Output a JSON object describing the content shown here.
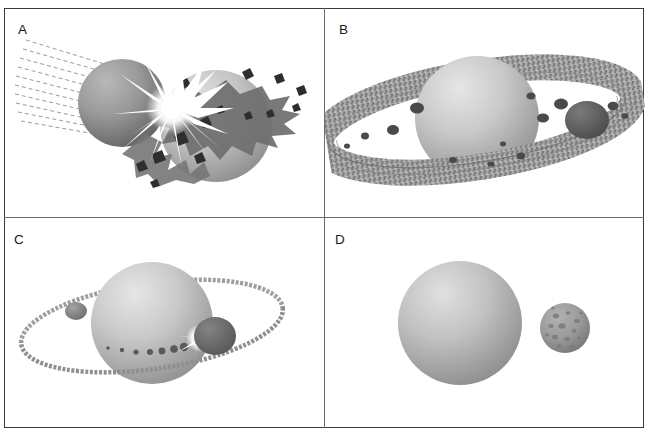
{
  "figure": {
    "type": "scientific-illustration",
    "background_color": "#ffffff",
    "frame_color": "#3a3a3a",
    "divider_color": "#6d6d6d",
    "panel_count": 4,
    "layout": "2x2 grid"
  },
  "panels": [
    {
      "id": "a",
      "label": "A",
      "stage": "giant impact",
      "description": "An incoming impactor body strikes a larger proto-planet. Dashed trajectory lines trace the impactor's approach path from the upper left. A bright white flash of radiating spikes marks the collision point, and a dark jagged ejecta plume with angular debris chunks is thrown off the far side.",
      "elements": {
        "trajectory_lines": {
          "count": 10,
          "style": "dashed",
          "color": "#9a9a9a"
        },
        "impactor": {
          "fill_light": "#a8a8a8",
          "fill_dark": "#6e6e6e",
          "cx": 118,
          "cy": 95,
          "r": 44
        },
        "target_planet": {
          "fill_light": "#d2d2d2",
          "fill_dark": "#8f8f8f",
          "cx": 212,
          "cy": 118,
          "r": 56
        },
        "impact_flash": {
          "color": "#ffffff",
          "cx": 168,
          "cy": 100,
          "spikes": 16
        },
        "ejecta_plume": {
          "color": "#6f6f6f"
        },
        "debris_chunks": {
          "count": 12,
          "color": "#2e2e2e"
        }
      }
    },
    {
      "id": "b",
      "label": "B",
      "stage": "debris disk",
      "description": "Impact ejecta settles into a broad, granular circumplanetary debris disk encircling the planet. The disk shows concentric banding and embedded dark clumps, with one large dark moonlet already coalescing on the right-hand side.",
      "elements": {
        "planet": {
          "fill_light": "#d6d6d6",
          "fill_dark": "#9a9a9a",
          "cx": 152,
          "cy": 110,
          "r": 62
        },
        "debris_disk": {
          "color": "#9c9c9c",
          "texture": "granular-speckled",
          "rx": 158,
          "ry": 46,
          "tilt_deg": -9
        },
        "disk_clumps": {
          "count": 14,
          "color": "#4a4a4a"
        },
        "large_moonlet": {
          "color": "#5e5e5e",
          "cx": 262,
          "cy": 112,
          "r": 20
        }
      }
    },
    {
      "id": "c",
      "label": "C",
      "stage": "moonlet accretion",
      "description": "The disk has thinned into a narrow ring. Two moonlets have accreted from the ring material — a small one at left and a larger one at right, which shows a bright flash as it sweeps up remaining ring particles.",
      "elements": {
        "planet": {
          "fill_light": "#d6d6d6",
          "fill_dark": "#9a9a9a",
          "cx": 148,
          "cy": 105,
          "r": 61
        },
        "thin_ring": {
          "color": "#9e9e9e",
          "rx": 132,
          "ry": 42,
          "tilt_deg": -8
        },
        "moonlet_small": {
          "color": "#8a8a8a",
          "cx": 72,
          "cy": 93,
          "r": 10
        },
        "moonlet_large": {
          "color": "#6a6a6a",
          "cx": 209,
          "cy": 118,
          "r": 20
        },
        "accretion_flash": {
          "color": "#ffffff",
          "cx": 196,
          "cy": 120
        },
        "sweeping_particles": {
          "count": 7,
          "color": "#5a5a5a"
        }
      }
    },
    {
      "id": "d",
      "label": "D",
      "stage": "final moon",
      "description": "The ring is gone. A single cratered moon remains in orbit beside the planet, its surface pockmarked by impacts.",
      "elements": {
        "planet": {
          "fill_light": "#cfcfcf",
          "fill_dark": "#949494",
          "cx": 135,
          "cy": 105,
          "r": 62
        },
        "moon": {
          "fill_light": "#a5a5a5",
          "fill_dark": "#7d7d7d",
          "cx": 240,
          "cy": 110,
          "r": 25,
          "crater_count": 14
        }
      }
    }
  ]
}
